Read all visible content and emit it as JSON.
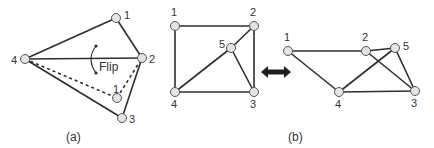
{
  "figure": {
    "panel_a": {
      "caption": "(a)",
      "flip_label": "Flip",
      "nodes": [
        {
          "id": "1",
          "label": "1",
          "x": 116,
          "y": 18,
          "lx": 124,
          "ly": 19
        },
        {
          "id": "2",
          "label": "2",
          "x": 142,
          "y": 58,
          "lx": 149,
          "ly": 63
        },
        {
          "id": "3",
          "label": "3",
          "x": 122,
          "y": 118,
          "lx": 129,
          "ly": 123
        },
        {
          "id": "4",
          "label": "4",
          "x": 25,
          "y": 59,
          "lx": 11,
          "ly": 64
        },
        {
          "id": "1b",
          "label": "1",
          "x": 117,
          "y": 98,
          "lx": 113,
          "ly": 93
        }
      ],
      "edges_solid": [
        [
          "4",
          "1"
        ],
        [
          "1",
          "2"
        ],
        [
          "4",
          "2"
        ],
        [
          "2",
          "3"
        ],
        [
          "4",
          "3"
        ]
      ],
      "edges_dashed": [
        [
          "4",
          "1b"
        ],
        [
          "1b",
          "2"
        ]
      ]
    },
    "arrow": {
      "symbol": "double-arrow",
      "x1": 261,
      "x2": 291,
      "y": 72
    },
    "panel_b_left": {
      "nodes": [
        {
          "id": "1",
          "label": "1",
          "x": 175,
          "y": 26,
          "lx": 171,
          "ly": 16
        },
        {
          "id": "2",
          "label": "2",
          "x": 254,
          "y": 26,
          "lx": 250,
          "ly": 16
        },
        {
          "id": "3",
          "label": "3",
          "x": 254,
          "y": 92,
          "lx": 250,
          "ly": 108
        },
        {
          "id": "4",
          "label": "4",
          "x": 175,
          "y": 92,
          "lx": 171,
          "ly": 108
        },
        {
          "id": "5",
          "label": "5",
          "x": 231,
          "y": 48,
          "lx": 219,
          "ly": 48
        }
      ],
      "edges": [
        [
          "1",
          "2"
        ],
        [
          "1",
          "4"
        ],
        [
          "4",
          "3"
        ],
        [
          "2",
          "3"
        ],
        [
          "2",
          "5"
        ],
        [
          "5",
          "4"
        ],
        [
          "5",
          "3"
        ]
      ]
    },
    "panel_b_right": {
      "caption": "(b)",
      "nodes": [
        {
          "id": "1",
          "label": "1",
          "x": 288,
          "y": 51,
          "lx": 284,
          "ly": 41
        },
        {
          "id": "2",
          "label": "2",
          "x": 366,
          "y": 51,
          "lx": 362,
          "ly": 41
        },
        {
          "id": "3",
          "label": "3",
          "x": 415,
          "y": 91,
          "lx": 411,
          "ly": 107
        },
        {
          "id": "4",
          "label": "4",
          "x": 339,
          "y": 92,
          "lx": 335,
          "ly": 108
        },
        {
          "id": "5",
          "label": "5",
          "x": 395,
          "y": 48,
          "lx": 403,
          "ly": 50
        }
      ],
      "edges": [
        [
          "1",
          "2"
        ],
        [
          "1",
          "4"
        ],
        [
          "4",
          "3"
        ],
        [
          "2",
          "5"
        ],
        [
          "5",
          "3"
        ],
        [
          "5",
          "4"
        ],
        [
          "2",
          "3"
        ]
      ]
    }
  },
  "colors": {
    "edge": "#2e2e2e",
    "node_fill": "#e4e4e4",
    "node_stroke": "#555555",
    "text": "#333333"
  }
}
